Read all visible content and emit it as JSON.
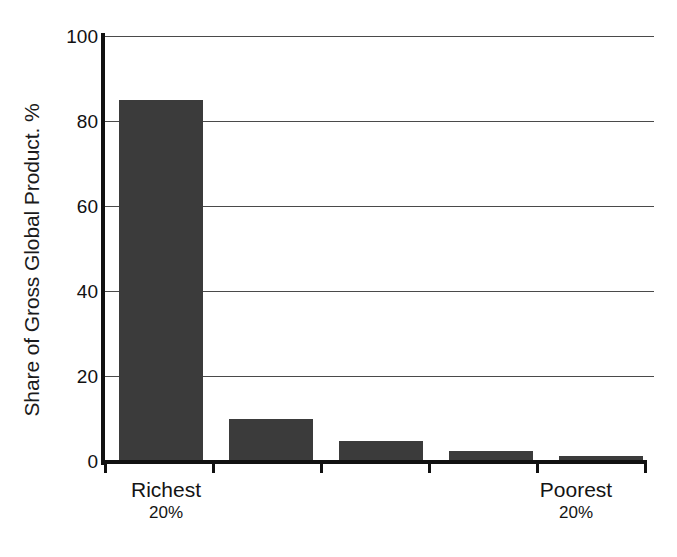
{
  "chart_data": {
    "type": "bar",
    "title": "",
    "subtitle": "",
    "xlabel": "",
    "ylabel": "Share of Gross Global Product. %",
    "categories": [
      "Richest 20%",
      "Second 20%",
      "Third 20%",
      "Fourth 20%",
      "Poorest 20%"
    ],
    "values": [
      85,
      10,
      5,
      2.5,
      1.5
    ],
    "ylim": [
      0,
      100
    ],
    "y_ticks": [
      0,
      20,
      40,
      60,
      80,
      100
    ],
    "y_tick_labels": [
      "0",
      "20",
      "40",
      "60",
      "80",
      "100"
    ],
    "grid": true,
    "grid_axis": "y",
    "legend": false,
    "legend_position": "none",
    "bar_color": "#3b3b3b",
    "axis_color": "#111111",
    "gridline_color": "#4a4a4a",
    "background_color": "#ffffff",
    "series": [
      {
        "name": "Share of Gross Global Product",
        "values": [
          85,
          10,
          5,
          2.5,
          1.5
        ]
      }
    ]
  },
  "axis": {
    "y_title": "Share of Gross Global Product. %",
    "y_ticks": [
      {
        "label": "100",
        "value": 100
      },
      {
        "label": "80",
        "value": 80
      },
      {
        "label": "60",
        "value": 60
      },
      {
        "label": "40",
        "value": 40
      },
      {
        "label": "20",
        "value": 20
      },
      {
        "label": "0",
        "value": 0
      }
    ]
  },
  "x_labels": {
    "left": {
      "name": "Richest",
      "sub": "20%"
    },
    "right": {
      "name": "Poorest",
      "sub": "20%"
    }
  }
}
